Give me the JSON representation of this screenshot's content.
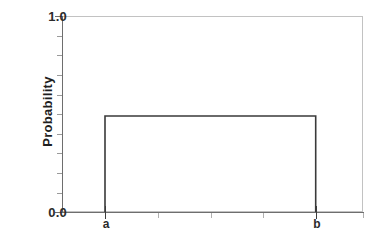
{
  "chart_data": {
    "type": "line",
    "title": "",
    "subtitle": "",
    "xlabel": "",
    "ylabel": "Probability",
    "ylim": [
      0.0,
      1.0
    ],
    "y_tick_labels": [
      "0.0",
      "1.0"
    ],
    "y_major_ticks": [
      0.0,
      1.0
    ],
    "y_minor_ticks": [
      0.1,
      0.2,
      0.3,
      0.4,
      0.5,
      0.6,
      0.7,
      0.8,
      0.9
    ],
    "x_tick_labels": [
      "a",
      "b"
    ],
    "x_major_ticks": [
      "a",
      "b"
    ],
    "x_minor_tick_count": 4,
    "grid": false,
    "legend": null,
    "series": [
      {
        "name": "uniform-pdf",
        "x": [
          "a",
          "a",
          "b",
          "b"
        ],
        "values": [
          0.0,
          0.49,
          0.49,
          0.0
        ],
        "color": "#3a3a3a"
      }
    ],
    "plateau_value": 0.49,
    "annotations": []
  },
  "axes": {
    "y": {
      "label": "Probability",
      "ticks": [
        {
          "value": "1.0",
          "pos": 1.0
        },
        {
          "value": "0.0",
          "pos": 0.0
        }
      ]
    },
    "x": {
      "label": "",
      "ticks": [
        {
          "value": "a",
          "pos": 0.143
        },
        {
          "value": "b",
          "pos": 0.843
        }
      ]
    }
  },
  "colors": {
    "curve": "#3a3a3a",
    "frame": "#c2c2c2",
    "spine": "#6e6e6e",
    "text": "#1f1f1f",
    "tick_minor": "#b0b0b0",
    "background": "#ffffff"
  }
}
